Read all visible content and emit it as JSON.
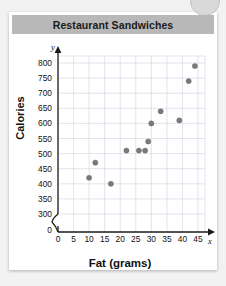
{
  "card": {
    "title": "Restaurant Sandwiches",
    "banner_color": "#b8b8b8",
    "background": "#ffffff"
  },
  "decor": {
    "corner_circle": "circle-decoration"
  },
  "chart_data": {
    "type": "scatter",
    "title": "Restaurant Sandwiches",
    "xlabel": "Fat (grams)",
    "ylabel": "Calories",
    "x_axis_letter": "x",
    "y_axis_letter": "y",
    "xlim": [
      0,
      47
    ],
    "ylim": [
      300,
      820
    ],
    "y_axis_break": true,
    "y_break_label": "0",
    "grid": true,
    "legend": "none",
    "point_color": "#7a7a7a",
    "xticks": [
      0,
      5,
      10,
      15,
      20,
      25,
      30,
      35,
      40,
      45
    ],
    "yticks": [
      300,
      350,
      400,
      450,
      500,
      550,
      600,
      650,
      700,
      750,
      800
    ],
    "points": [
      {
        "x": 10,
        "y": 420
      },
      {
        "x": 12,
        "y": 470
      },
      {
        "x": 17,
        "y": 400
      },
      {
        "x": 22,
        "y": 510
      },
      {
        "x": 26,
        "y": 510
      },
      {
        "x": 28,
        "y": 510
      },
      {
        "x": 29,
        "y": 540
      },
      {
        "x": 30,
        "y": 600
      },
      {
        "x": 33,
        "y": 640
      },
      {
        "x": 39,
        "y": 610
      },
      {
        "x": 42,
        "y": 740
      },
      {
        "x": 44,
        "y": 790
      }
    ]
  }
}
